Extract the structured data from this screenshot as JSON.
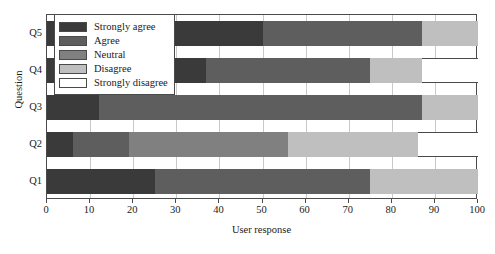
{
  "chart_data": {
    "type": "bar",
    "orientation": "horizontal",
    "stacked": true,
    "title": "",
    "xlabel": "User response",
    "ylabel": "Question",
    "xlim": [
      0,
      100
    ],
    "xticks": [
      0,
      10,
      20,
      30,
      40,
      50,
      60,
      70,
      80,
      90,
      100
    ],
    "grid": true,
    "legend_position": "upper left",
    "categories": [
      "Q1",
      "Q2",
      "Q3",
      "Q4",
      "Q5"
    ],
    "categories_top_to_bottom": [
      "Q5",
      "Q4",
      "Q3",
      "Q2",
      "Q1"
    ],
    "series": [
      {
        "name": "Strongly agree",
        "color": "#3a3a3a",
        "values": [
          25,
          6,
          12,
          37,
          50
        ]
      },
      {
        "name": "Agree",
        "color": "#5e5e5e",
        "values": [
          50,
          13,
          75,
          38,
          37
        ]
      },
      {
        "name": "Neutral",
        "color": "#808080",
        "values": [
          0,
          37,
          0,
          0,
          0
        ]
      },
      {
        "name": "Disagree",
        "color": "#bfbfbf",
        "values": [
          25,
          30,
          13,
          12,
          13
        ]
      },
      {
        "name": "Strongly disagree",
        "color": "#ffffff",
        "values": [
          0,
          14,
          0,
          13,
          0
        ]
      }
    ],
    "legend_entries": [
      {
        "label": "Strongly agree",
        "color": "#3a3a3a"
      },
      {
        "label": "Agree",
        "color": "#5e5e5e"
      },
      {
        "label": "Neutral",
        "color": "#808080"
      },
      {
        "label": "Disagree",
        "color": "#bfbfbf"
      },
      {
        "label": "Strongly disagree",
        "color": "#ffffff"
      }
    ]
  }
}
